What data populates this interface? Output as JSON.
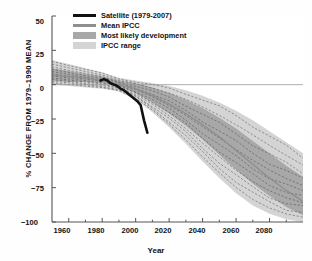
{
  "chart_data": {
    "type": "line",
    "title": "",
    "xlabel": "Year",
    "ylabel": "% CHANGE FROM 1979–1990 MEAN",
    "xlim": [
      1950,
      2100
    ],
    "ylim": [
      -100,
      50
    ],
    "xticks": [
      1960,
      1980,
      2000,
      2020,
      2040,
      2060,
      2080
    ],
    "yticks": [
      50,
      25,
      0,
      -25,
      -50,
      -75,
      -100
    ],
    "grid": false,
    "legend_position": "top-left",
    "legend": [
      {
        "label": "Satellite (1979-2007)",
        "marker": "thick-black-line",
        "color": "#111111"
      },
      {
        "label": "Mean IPCC",
        "marker": "thin-gray-line",
        "color": "#8e8e8e"
      },
      {
        "label": "Most likely development",
        "marker": "dark-gray-band",
        "color": "#a8a8a8"
      },
      {
        "label": "IPCC range",
        "marker": "light-gray-band",
        "color": "#d4d4d4"
      }
    ],
    "series": [
      {
        "name": "Satellite (1979-2007)",
        "type": "line",
        "color": "#111111",
        "x": [
          1979,
          1981,
          1983,
          1985,
          1987,
          1989,
          1991,
          1993,
          1995,
          1997,
          1999,
          2001,
          2003,
          2005,
          2007
        ],
        "values": [
          3,
          4,
          3,
          1,
          0,
          -1,
          -3,
          -4,
          -6,
          -8,
          -10,
          -12,
          -15,
          -26,
          -35
        ]
      },
      {
        "name": "Mean IPCC",
        "type": "line",
        "color": "#8e8e8e",
        "x": [
          1950,
          1960,
          1970,
          1980,
          1990,
          2000,
          2010,
          2020,
          2030,
          2040,
          2050,
          2060,
          2070,
          2080,
          2090,
          2100
        ],
        "values": [
          7,
          6,
          5,
          3,
          0,
          -3,
          -8,
          -14,
          -21,
          -29,
          -38,
          -48,
          -58,
          -68,
          -77,
          -85
        ]
      },
      {
        "name": "Most likely development (upper)",
        "type": "band-edge",
        "color": "#a8a8a8",
        "x": [
          1950,
          1960,
          1970,
          1980,
          1990,
          2000,
          2010,
          2020,
          2030,
          2040,
          2050,
          2060,
          2070,
          2080,
          2090,
          2100
        ],
        "values": [
          12,
          10,
          8,
          6,
          3,
          1,
          -2,
          -6,
          -11,
          -17,
          -24,
          -32,
          -41,
          -50,
          -59,
          -67
        ]
      },
      {
        "name": "Most likely development (lower)",
        "type": "band-edge",
        "color": "#a8a8a8",
        "x": [
          1950,
          1960,
          1970,
          1980,
          1990,
          2000,
          2010,
          2020,
          2030,
          2040,
          2050,
          2060,
          2070,
          2080,
          2090,
          2100
        ],
        "values": [
          3,
          2,
          2,
          1,
          -1,
          -6,
          -13,
          -21,
          -30,
          -40,
          -51,
          -62,
          -72,
          -81,
          -89,
          -95
        ]
      },
      {
        "name": "IPCC range (upper)",
        "type": "band-edge",
        "color": "#d4d4d4",
        "x": [
          1950,
          1960,
          1970,
          1980,
          1990,
          2000,
          2010,
          2020,
          2030,
          2040,
          2050,
          2060,
          2070,
          2080,
          2090,
          2100
        ],
        "values": [
          18,
          15,
          12,
          9,
          5,
          3,
          1,
          -1,
          -4,
          -8,
          -13,
          -19,
          -26,
          -34,
          -42,
          -50
        ]
      },
      {
        "name": "IPCC range (lower)",
        "type": "band-edge",
        "color": "#d4d4d4",
        "x": [
          1950,
          1960,
          1970,
          1980,
          1990,
          2000,
          2010,
          2020,
          2030,
          2040,
          2050,
          2060,
          2070,
          2080,
          2090,
          2100
        ],
        "values": [
          0,
          -1,
          -2,
          -3,
          -5,
          -11,
          -20,
          -31,
          -43,
          -56,
          -68,
          -79,
          -88,
          -94,
          -98,
          -100
        ]
      }
    ],
    "model_runs_note": "individual IPCC model runs shown as thin dashed dark lines"
  },
  "axis": {
    "ylabel": "% CHANGE FROM 1979–1990 MEAN",
    "xlabel": "Year",
    "yticks": [
      "50",
      "25",
      "0",
      "−25",
      "−50",
      "−75",
      "−100"
    ],
    "xticks": [
      "1960",
      "1980",
      "2000",
      "2020",
      "2040",
      "2060",
      "2080"
    ]
  },
  "legend": {
    "items": [
      {
        "label": "Satellite (1979-2007)"
      },
      {
        "label": "Mean IPCC"
      },
      {
        "label": "Most likely development"
      },
      {
        "label": "IPCC range"
      }
    ]
  },
  "colors": {
    "satellite": "#111111",
    "mean_ipcc": "#8e8e8e",
    "most_likely": "#a8a8a8",
    "ipcc_range": "#d4d4d4",
    "axis": "#555555",
    "background": "#fefefe"
  }
}
